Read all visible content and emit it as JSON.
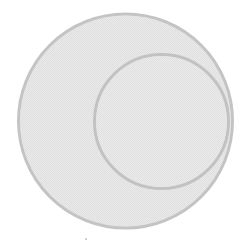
{
  "diagram": {
    "type": "subset-venn",
    "background": "#ffffff",
    "pattern_light": "#ececec",
    "pattern_dark": "#dcdcdc",
    "shapes": [
      {
        "id": "outer-set",
        "kind": "circle",
        "cx": 125.5,
        "cy": 121,
        "r": 107,
        "fill": "#e5e5e5",
        "stroke": "#c4c4c4",
        "stroke_width": 3
      },
      {
        "id": "inner-set",
        "kind": "circle",
        "cx": 161.5,
        "cy": 121.5,
        "r": 67,
        "fill": "#e7e7e7",
        "stroke": "#c2c2c2",
        "stroke_width": 3
      }
    ],
    "marks": [
      {
        "id": "speck",
        "cx": 86,
        "cy": 239,
        "r": 0.9,
        "fill": "#b8b8b8"
      }
    ]
  }
}
